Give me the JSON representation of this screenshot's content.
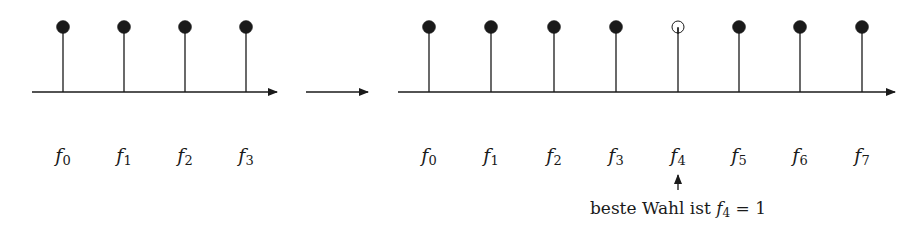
{
  "diagram": {
    "left_panel": {
      "samples": [
        {
          "label": "f",
          "index": "0",
          "x": 63,
          "filled": true
        },
        {
          "label": "f",
          "index": "1",
          "x": 124,
          "filled": true
        },
        {
          "label": "f",
          "index": "2",
          "x": 185,
          "filled": true
        },
        {
          "label": "f",
          "index": "3",
          "x": 246,
          "filled": true
        }
      ]
    },
    "transition_arrow": "→",
    "right_panel": {
      "samples": [
        {
          "label": "f",
          "index": "0",
          "x": 429,
          "filled": true
        },
        {
          "label": "f",
          "index": "1",
          "x": 491,
          "filled": true
        },
        {
          "label": "f",
          "index": "2",
          "x": 554,
          "filled": true
        },
        {
          "label": "f",
          "index": "3",
          "x": 616,
          "filled": true
        },
        {
          "label": "f",
          "index": "4",
          "x": 678,
          "filled": false
        },
        {
          "label": "f",
          "index": "5",
          "x": 739,
          "filled": true
        },
        {
          "label": "f",
          "index": "6",
          "x": 800,
          "filled": true
        },
        {
          "label": "f",
          "index": "7",
          "x": 862,
          "filled": true
        }
      ]
    },
    "annotation": {
      "prefix": "beste Wahl ist",
      "var": "f",
      "index": "4",
      "suffix": "= 1"
    },
    "colors": {
      "stroke": "#1a1a1a",
      "fill": "#1a1a1a",
      "background": "#ffffff"
    }
  }
}
